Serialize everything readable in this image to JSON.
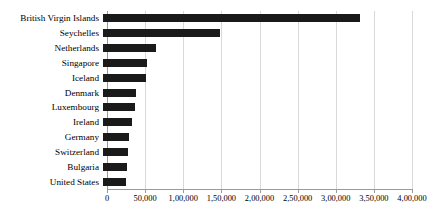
{
  "chart_data": {
    "type": "bar",
    "orientation": "horizontal",
    "title": "",
    "subtitle": "",
    "xlabel": "",
    "ylabel": "",
    "xlim": [
      0,
      400000
    ],
    "grid": true,
    "legend": false,
    "legend_position": "none",
    "bar_color": "#1a1a1a",
    "gridline_color": "#d9d9d9",
    "axis_color": "#9a9a9a",
    "number_format": "indian-grouping",
    "categories": [
      "British Virgin Islands",
      "Seychelles",
      "Netherlands",
      "Singapore",
      "Iceland",
      "Denmark",
      "Luxembourg",
      "Ireland",
      "Germany",
      "Switzerland",
      "Bulgaria",
      "United States"
    ],
    "values": [
      337000,
      154000,
      70000,
      58000,
      57000,
      43000,
      42000,
      38000,
      34000,
      33000,
      32000,
      30000
    ],
    "xticks": [
      0,
      50000,
      100000,
      150000,
      200000,
      250000,
      300000,
      350000,
      400000
    ],
    "xtick_labels": [
      "0",
      "50,000",
      "1,00,000",
      "1,50,000",
      "2,00,000",
      "2,50,000",
      "3,00,000",
      "3,50,000",
      "4,00,000"
    ]
  }
}
